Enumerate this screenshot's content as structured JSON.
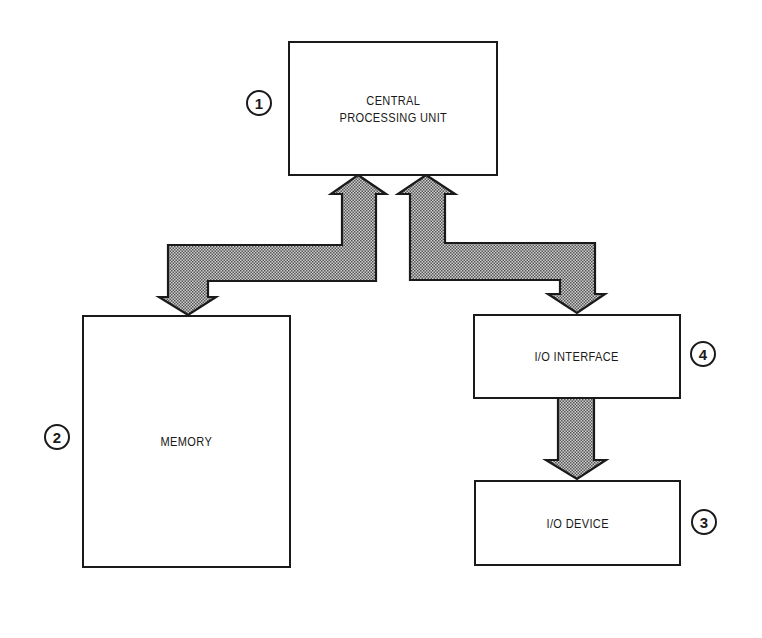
{
  "diagram": {
    "type": "block-diagram",
    "blocks": [
      {
        "id": "cpu",
        "number": "1",
        "label": "CENTRAL\nPROCESSING UNIT"
      },
      {
        "id": "memory",
        "number": "2",
        "label": "MEMORY"
      },
      {
        "id": "io_device",
        "number": "3",
        "label": "I/O DEVICE"
      },
      {
        "id": "io_interface",
        "number": "4",
        "label": "I/O INTERFACE"
      }
    ],
    "connections": [
      {
        "from": "cpu",
        "to": "memory",
        "direction": "bidirectional"
      },
      {
        "from": "cpu",
        "to": "io_interface",
        "direction": "bidirectional"
      },
      {
        "from": "io_interface",
        "to": "io_device",
        "direction": "unidirectional"
      }
    ],
    "colors": {
      "outline": "#1a1a1a",
      "arrow_fill": "#a9a9a9",
      "background": "#ffffff"
    }
  }
}
